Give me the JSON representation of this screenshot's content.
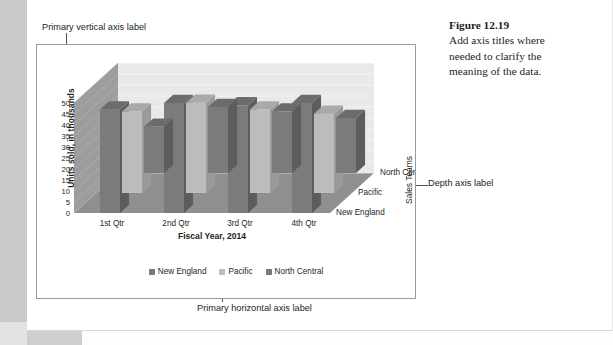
{
  "caption": {
    "figure_number": "Figure 12.19",
    "text": "Add axis titles where needed to clarify the meaning of the data."
  },
  "annotations": {
    "vertical_axis": "Primary vertical axis label",
    "horizontal_axis": "Primary horizontal axis label",
    "depth_axis": "Depth axis label"
  },
  "chart_data": {
    "type": "bar",
    "variant": "3d-grouped-column",
    "title": "",
    "xlabel": "Fiscal Year, 2014",
    "ylabel": "Units sold, in thousands",
    "zlabel": "Sales Teams",
    "categories": [
      "1st Qtr",
      "2nd Qtr",
      "3rd Qtr",
      "4th Qtr"
    ],
    "depth_categories": [
      "New England",
      "Pacific",
      "North Central"
    ],
    "series": [
      {
        "name": "New England",
        "color": "#7b7b7b",
        "values": [
          21,
          30,
          28,
          25
        ]
      },
      {
        "name": "Pacific",
        "color": "#bcbcbc",
        "values": [
          37,
          41,
          38,
          36
        ]
      },
      {
        "name": "North Central",
        "color": "#7b7b7b",
        "values": [
          47,
          50,
          49,
          50
        ]
      }
    ],
    "yticks": [
      0,
      5,
      10,
      15,
      20,
      25,
      30,
      35,
      40,
      45,
      50
    ],
    "ylim": [
      0,
      50
    ],
    "grid": true,
    "legend_position": "bottom",
    "legend_entries": [
      "New England",
      "Pacific",
      "North Central"
    ]
  },
  "colors": {
    "bar_dark": "#7b7b7b",
    "bar_light": "#bcbcbc",
    "bar_dark_side": "#5d5d5d",
    "bar_light_side": "#9a9a9a",
    "bar_dark_top": "#6c6c6c",
    "bar_light_top": "#a9a9a9",
    "wall_back": "#e9e9e9",
    "wall_side": "#9d9d9d",
    "floor": "#8f8f8f",
    "frame_border": "#9a9a9a",
    "page_edge": "#c9c9c9"
  }
}
